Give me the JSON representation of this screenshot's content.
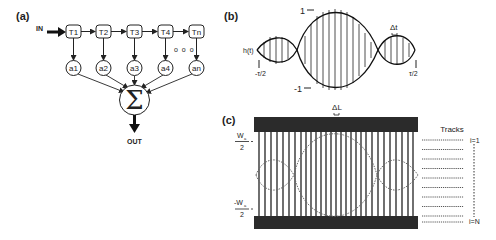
{
  "panels": {
    "a": {
      "label": "(a)",
      "input_label": "IN",
      "output_label": "OUT",
      "taps": [
        "T1",
        "T2",
        "T3",
        "T4",
        "Tn"
      ],
      "weights": [
        "a1",
        "a2",
        "a3",
        "a4",
        "an"
      ],
      "ellipsis": "o o o",
      "sum_symbol": "Σ"
    },
    "b": {
      "label": "(b)",
      "signal_label": "h(t)",
      "max_label": "1",
      "min_label": "-1",
      "left_time_label": "-τ/2",
      "right_time_label": "τ/2",
      "sample_spacing_label": "Δt"
    },
    "c": {
      "label": "(c)",
      "top_width_label_num": "W",
      "top_width_label_sub": "a",
      "top_width_label_den": "2",
      "bottom_width_label_num": "-W",
      "bottom_width_label_sub": "a",
      "bottom_width_label_den": "2",
      "electrode_spacing_label": "ΔL",
      "tracks_title": "Tracks",
      "track_first_label": "i=1",
      "track_last_label": "i=N",
      "track_count": 10
    }
  },
  "colors": {
    "ink": "#222222",
    "bar": "#2b2b2b",
    "background": "#ffffff"
  }
}
